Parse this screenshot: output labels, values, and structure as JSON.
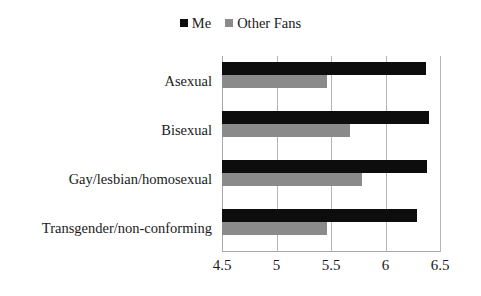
{
  "chart_data": {
    "type": "bar",
    "orientation": "horizontal",
    "title": "",
    "subtitle": "",
    "xlabel": "",
    "ylabel": "",
    "xlim": [
      4.5,
      6.5
    ],
    "xticks": [
      "4.5",
      "5",
      "5.5",
      "6",
      "6.5"
    ],
    "xtick_values": [
      4.5,
      5,
      5.5,
      6,
      6.5
    ],
    "grid": "vertical",
    "legend_position": "top-center",
    "categories": [
      "Asexual",
      "Bisexual",
      "Gay/lesbian/homosexual",
      "Transgender/non-conforming"
    ],
    "series": [
      {
        "name": "Me",
        "color": "#0d0d0d",
        "values": [
          6.37,
          6.4,
          6.38,
          6.29
        ]
      },
      {
        "name": "Other Fans",
        "color": "#8a8a8a",
        "values": [
          5.46,
          5.67,
          5.78,
          5.46
        ]
      }
    ]
  },
  "legend": {
    "entries": [
      {
        "label": "Me",
        "color": "#0d0d0d",
        "icon": "square-swatch-icon"
      },
      {
        "label": "Other Fans",
        "color": "#8a8a8a",
        "icon": "square-swatch-icon"
      }
    ]
  }
}
